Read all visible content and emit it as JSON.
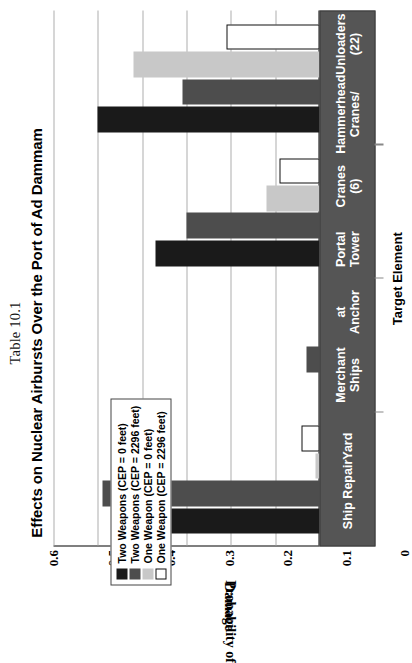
{
  "table_number": "Table 10.1",
  "title": "Effects on Nuclear Airbursts Over the Port of Ad Dammam",
  "axis": {
    "ylabel_line1": "Probability of",
    "ylabel_line2": "Damage",
    "xlabel": "Target Element"
  },
  "legend": {
    "items": [
      {
        "label": "Two Weapons (CEP = 0 feet)",
        "color": "#1a1a1a",
        "swatch": "legend-swatch-black"
      },
      {
        "label": "Two Weapons (CEP = 2296 feet)",
        "color": "#4d4d4d",
        "swatch": "legend-swatch-darkgray"
      },
      {
        "label": "One Weapon (CEP = 0 feet)",
        "color": "#c8c8c8",
        "swatch": "legend-swatch-lightgray"
      },
      {
        "label": "One Weapon (CEP = 2296 feet)",
        "color": "#ffffff",
        "swatch": "legend-swatch-white"
      }
    ]
  },
  "chart_data": {
    "type": "bar",
    "title": "Effects on Nuclear Airbursts Over the Port of Ad Dammam",
    "xlabel": "Target Element",
    "ylabel": "Probability of Damage",
    "ylim": [
      0,
      0.6
    ],
    "yticks": [
      "0",
      "0.1",
      "0.2",
      "0.3",
      "0.4",
      "0.5",
      "0.6"
    ],
    "ytick_values": [
      0,
      0.1,
      0.2,
      0.3,
      0.4,
      0.5,
      0.6
    ],
    "grid": true,
    "legend_position": "upper-left",
    "orientation": "vertical",
    "categories": [
      "Ship Repair\nYard",
      "Merchant Ships\nat Anchor",
      "Portal Tower\nCranes (6)",
      "Hammerhead Cranes/\nUnloaders (22)"
    ],
    "category_labels": [
      {
        "line1": "Ship Repair",
        "line2": "Yard"
      },
      {
        "line1": "Merchant Ships",
        "line2": "at Anchor"
      },
      {
        "line1": "Portal Tower",
        "line2": "Cranes (6)"
      },
      {
        "line1": "Hammerhead Cranes/",
        "line2": "Unloaders (22)"
      }
    ],
    "series": [
      {
        "name": "Two Weapons (CEP = 0 feet)",
        "color": "#1a1a1a",
        "values": [
          0.4,
          0.0,
          0.37,
          0.5
        ]
      },
      {
        "name": "Two Weapons (CEP = 2296 feet)",
        "color": "#4d4d4d",
        "values": [
          0.49,
          0.03,
          0.3,
          0.31
        ]
      },
      {
        "name": "One Weapon (CEP = 0 feet)",
        "color": "#c8c8c8",
        "values": [
          0.01,
          0.0,
          0.12,
          0.42
        ]
      },
      {
        "name": "One Weapon (CEP = 2296 feet)",
        "color": "#ffffff",
        "values": [
          0.04,
          0.0,
          0.09,
          0.21
        ]
      }
    ]
  }
}
